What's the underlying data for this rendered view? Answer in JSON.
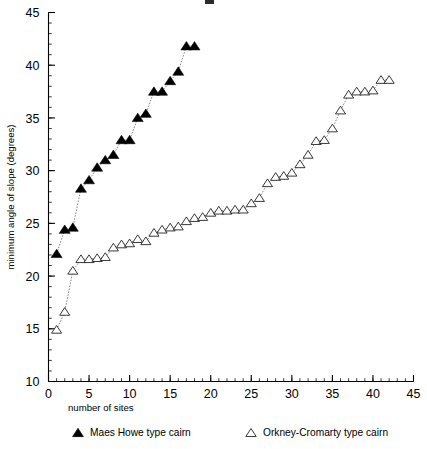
{
  "chart_data": {
    "type": "scatter",
    "title": "",
    "xlabel": "number of sites",
    "ylabel": "minimum angle of slope (degrees)",
    "xlim": [
      0,
      45
    ],
    "ylim": [
      10,
      45
    ],
    "xticks": [
      0,
      5,
      10,
      15,
      20,
      25,
      30,
      35,
      40,
      45
    ],
    "xticklabels": [
      "0",
      "5",
      "10",
      "15",
      "20",
      "25",
      "30",
      "35",
      "40",
      "45"
    ],
    "yticks": [
      10,
      15,
      20,
      25,
      30,
      35,
      40,
      45
    ],
    "yticklabels": [
      "10",
      "15",
      "20",
      "25",
      "30",
      "35",
      "40",
      "45"
    ],
    "xminor_step": 1,
    "yminor_step": 1,
    "grid": false,
    "legend_position": "below-axes",
    "connect_points": true,
    "series": [
      {
        "name": "Maes Howe type cairn",
        "marker": "filled-triangle-up",
        "color": "#000000",
        "x": [
          1,
          2,
          3,
          4,
          5,
          6,
          7,
          8,
          9,
          10,
          11,
          12,
          13,
          14,
          15,
          16,
          17,
          18
        ],
        "y": [
          22.1,
          24.4,
          24.6,
          28.3,
          29.1,
          30.3,
          31.0,
          31.5,
          32.9,
          32.9,
          35.0,
          35.4,
          37.5,
          37.5,
          38.5,
          39.4,
          41.8,
          41.8
        ],
        "values": [
          {
            "x": 1,
            "y": 22.1
          },
          {
            "x": 2,
            "y": 24.4
          },
          {
            "x": 3,
            "y": 24.6
          },
          {
            "x": 4,
            "y": 28.3
          },
          {
            "x": 5,
            "y": 29.1
          },
          {
            "x": 6,
            "y": 30.3
          },
          {
            "x": 7,
            "y": 31.0
          },
          {
            "x": 8,
            "y": 31.5
          },
          {
            "x": 9,
            "y": 32.9
          },
          {
            "x": 10,
            "y": 32.9
          },
          {
            "x": 11,
            "y": 35.0
          },
          {
            "x": 12,
            "y": 35.4
          },
          {
            "x": 13,
            "y": 37.5
          },
          {
            "x": 14,
            "y": 37.5
          },
          {
            "x": 15,
            "y": 38.5
          },
          {
            "x": 16,
            "y": 39.4
          },
          {
            "x": 17,
            "y": 41.8
          },
          {
            "x": 18,
            "y": 41.8
          }
        ]
      },
      {
        "name": "Orkney-Cromarty type cairn",
        "marker": "open-triangle-up",
        "color": "#222222",
        "x": [
          1,
          2,
          3,
          4,
          5,
          6,
          7,
          8,
          9,
          10,
          11,
          12,
          13,
          14,
          15,
          16,
          17,
          18,
          19,
          20,
          21,
          22,
          23,
          24,
          25,
          26,
          27,
          28,
          29,
          30,
          31,
          32,
          33,
          34,
          35,
          36,
          37,
          38,
          39,
          40,
          41,
          42
        ],
        "y": [
          14.9,
          16.6,
          20.5,
          21.6,
          21.6,
          21.7,
          21.8,
          22.7,
          23.0,
          23.1,
          23.5,
          23.3,
          24.1,
          24.4,
          24.6,
          24.7,
          25.2,
          25.5,
          25.6,
          26.0,
          26.2,
          26.2,
          26.3,
          26.3,
          26.9,
          27.4,
          28.8,
          29.4,
          29.5,
          29.8,
          30.6,
          31.5,
          32.8,
          32.9,
          34.0,
          35.7,
          37.2,
          37.5,
          37.5,
          37.6,
          38.6,
          38.6
        ],
        "values": [
          {
            "x": 1,
            "y": 14.9
          },
          {
            "x": 2,
            "y": 16.6
          },
          {
            "x": 3,
            "y": 20.5
          },
          {
            "x": 4,
            "y": 21.6
          },
          {
            "x": 5,
            "y": 21.6
          },
          {
            "x": 6,
            "y": 21.7
          },
          {
            "x": 7,
            "y": 21.8
          },
          {
            "x": 8,
            "y": 22.7
          },
          {
            "x": 9,
            "y": 23.0
          },
          {
            "x": 10,
            "y": 23.1
          },
          {
            "x": 11,
            "y": 23.5
          },
          {
            "x": 12,
            "y": 23.3
          },
          {
            "x": 13,
            "y": 24.1
          },
          {
            "x": 14,
            "y": 24.4
          },
          {
            "x": 15,
            "y": 24.6
          },
          {
            "x": 16,
            "y": 24.7
          },
          {
            "x": 17,
            "y": 25.2
          },
          {
            "x": 18,
            "y": 25.5
          },
          {
            "x": 19,
            "y": 25.6
          },
          {
            "x": 20,
            "y": 26.0
          },
          {
            "x": 21,
            "y": 26.2
          },
          {
            "x": 22,
            "y": 26.2
          },
          {
            "x": 23,
            "y": 26.3
          },
          {
            "x": 24,
            "y": 26.3
          },
          {
            "x": 25,
            "y": 26.9
          },
          {
            "x": 26,
            "y": 27.4
          },
          {
            "x": 27,
            "y": 28.8
          },
          {
            "x": 28,
            "y": 29.4
          },
          {
            "x": 29,
            "y": 29.5
          },
          {
            "x": 30,
            "y": 29.8
          },
          {
            "x": 31,
            "y": 30.6
          },
          {
            "x": 32,
            "y": 31.5
          },
          {
            "x": 33,
            "y": 32.8
          },
          {
            "x": 34,
            "y": 32.9
          },
          {
            "x": 35,
            "y": 34.0
          },
          {
            "x": 36,
            "y": 35.7
          },
          {
            "x": 37,
            "y": 37.2
          },
          {
            "x": 38,
            "y": 37.5
          },
          {
            "x": 39,
            "y": 37.5
          },
          {
            "x": 40,
            "y": 37.6
          },
          {
            "x": 41,
            "y": 38.6
          },
          {
            "x": 42,
            "y": 38.6
          }
        ]
      }
    ]
  },
  "legend": {
    "entries": [
      {
        "label": "Maes Howe type cairn",
        "marker": "filled-triangle-up"
      },
      {
        "label": "Orkney-Cromarty type cairn",
        "marker": "open-triangle-up"
      }
    ]
  }
}
